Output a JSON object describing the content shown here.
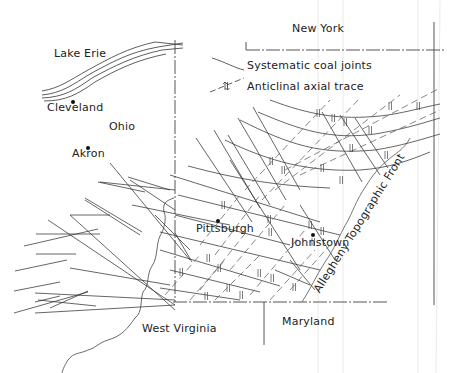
{
  "map": {
    "type": "geologic structure map",
    "labels": {
      "lake_erie": "Lake Erie",
      "cleveland": "Cleveland",
      "ohio": "Ohio",
      "akron": "Akron",
      "new_york": "New York",
      "pittsburgh": "Pittsburgh",
      "johnstown": "Johnstown",
      "west_virginia": "West Virginia",
      "maryland": "Maryland",
      "allegheny_front": "Allegheny Topographic Front"
    },
    "legend": {
      "items": [
        {
          "symbol": "solid-line",
          "label": "Systematic coal joints"
        },
        {
          "symbol": "dashed-line-with-anticline-arrows",
          "label": "Anticlinal axial trace"
        }
      ]
    },
    "cities": [
      "Cleveland",
      "Akron",
      "Pittsburgh",
      "Johnstown"
    ],
    "colors": {
      "ink": "#222222",
      "background": "#ffffff",
      "border": "#555555"
    }
  }
}
